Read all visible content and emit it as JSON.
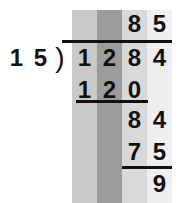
{
  "problem": {
    "divisor": "15",
    "dividend": [
      "1",
      "2",
      "8",
      "4"
    ],
    "quotient": [
      "8",
      "5"
    ],
    "step1_product": [
      "1",
      "2",
      "0"
    ],
    "step1_remainder": [
      "8",
      "4"
    ],
    "step2_product": [
      "7",
      "5"
    ],
    "remainder": "9",
    "bracket": ")"
  },
  "colors": {
    "col1": "#c9c9c9",
    "col2": "#9c9c9c",
    "col3": "#d9d9d9",
    "col4": "#efefef",
    "text": "#111111"
  }
}
